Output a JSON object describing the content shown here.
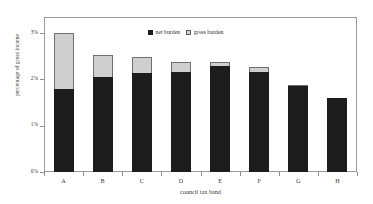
{
  "chart_data": {
    "type": "bar",
    "title": "",
    "xlabel": "council tax band",
    "ylabel": "percentage of gross income",
    "categories": [
      "A",
      "B",
      "C",
      "D",
      "E",
      "F",
      "G",
      "H"
    ],
    "ytick_labels": [
      "3%",
      "2%",
      "1%",
      "0%"
    ],
    "ytick_values": [
      3,
      2,
      1,
      0
    ],
    "ylim": [
      0,
      3.35
    ],
    "grid": false,
    "stacked": true,
    "legend_position": "top-center",
    "series": [
      {
        "name": "net burden",
        "color": "#1c1c1c",
        "values": [
          1.79,
          2.06,
          2.15,
          2.17,
          2.28,
          2.17,
          1.86,
          1.59
        ]
      },
      {
        "name": "gross burden",
        "color": "#cfcfcf",
        "values": [
          3.0,
          2.53,
          2.48,
          2.37,
          2.37,
          2.26,
          1.88,
          1.59
        ]
      }
    ]
  },
  "legend": {
    "net_label": "net burden",
    "gross_label": "gross burden"
  },
  "axes": {
    "x_title": "council tax band",
    "y_title": "percentage of gross income"
  }
}
